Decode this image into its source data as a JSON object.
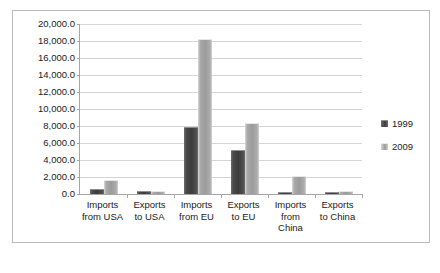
{
  "chart_data": {
    "type": "bar",
    "title": "",
    "subtitle": "",
    "xlabel": "",
    "ylabel": "",
    "grid": true,
    "legend_position": "right",
    "categories": [
      "Imports from USA",
      "Exports to USA",
      "Imports from EU",
      "Exports to EU",
      "Imports from China",
      "Exports to China"
    ],
    "category_lines": [
      [
        "Imports",
        "from USA"
      ],
      [
        "Exports",
        "to USA"
      ],
      [
        "Imports",
        "from EU"
      ],
      [
        "Exports",
        "to EU"
      ],
      [
        "Imports",
        "from",
        "China"
      ],
      [
        "Exports",
        "to China"
      ]
    ],
    "series": [
      {
        "name": "1999",
        "color": "#3c3c3c",
        "values": [
          550,
          300,
          7900,
          5200,
          250,
          100
        ]
      },
      {
        "name": "2009",
        "color": "#9b9b9b",
        "values": [
          1600,
          330,
          18200,
          8300,
          2100,
          300
        ]
      }
    ],
    "ylim": [
      0,
      20000
    ],
    "ytick_step": 2000,
    "ytick_labels": [
      "20,000.0",
      "18,000.0",
      "16,000.0",
      "14,000.0",
      "12,000.0",
      "10,000.0",
      "8,000.0",
      "6,000.0",
      "4,000.0",
      "2,000.0",
      "0.0"
    ],
    "ytick_values": [
      20000,
      18000,
      16000,
      14000,
      12000,
      10000,
      8000,
      6000,
      4000,
      2000,
      0
    ]
  },
  "legend": {
    "entries": [
      {
        "label": "1999"
      },
      {
        "label": "2009"
      }
    ]
  }
}
